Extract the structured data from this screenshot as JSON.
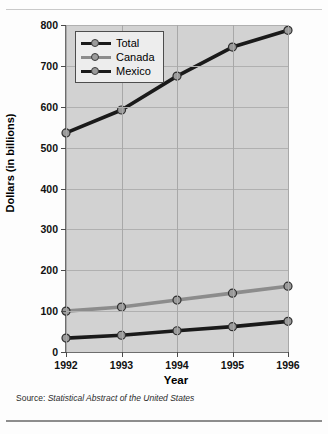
{
  "source_note": {
    "prefix": "Source:",
    "title": "Statistical Abstract of the United States"
  },
  "chart_data": {
    "type": "line",
    "title": "",
    "xlabel": "Year",
    "ylabel": "Dollars (in billions)",
    "categories": [
      "1992",
      "1993",
      "1994",
      "1995",
      "1996"
    ],
    "x": [
      1992,
      1993,
      1994,
      1995,
      1996
    ],
    "xlim": [
      1992,
      1996
    ],
    "ylim": [
      0,
      800
    ],
    "yticks": [
      0,
      100,
      200,
      300,
      400,
      500,
      600,
      700,
      800
    ],
    "ytick_labels": [
      "0",
      "100",
      "200",
      "300",
      "400",
      "500",
      "600",
      "700",
      "800"
    ],
    "grid": true,
    "legend_position": "upper-left",
    "series": [
      {
        "name": "Total",
        "color": "#1a1a1a",
        "marker_color": "#9a9a9a",
        "values": [
          536,
          592,
          675,
          746,
          787
        ]
      },
      {
        "name": "Canada",
        "color": "#8c8c8c",
        "marker_color": "#9a9a9a",
        "values": [
          100,
          110,
          127,
          144,
          161
        ]
      },
      {
        "name": "Mexico",
        "color": "#1a1a1a",
        "marker_color": "#9a9a9a",
        "values": [
          34,
          41,
          52,
          62,
          75
        ]
      }
    ]
  }
}
